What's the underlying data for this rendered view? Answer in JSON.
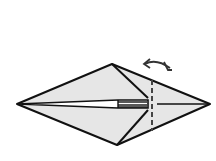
{
  "diagram": {
    "type": "origami-fold-step",
    "description": "Kite-shaped folded paper with valley fold line and fold-behind arrow",
    "colors": {
      "paper": "#e6e6e6",
      "outline": "#111111",
      "background": "#ffffff"
    },
    "elements": {
      "fold_line": "dashed vertical fold line",
      "arrow": "curved fold arrow (fold back and unfold)"
    }
  }
}
